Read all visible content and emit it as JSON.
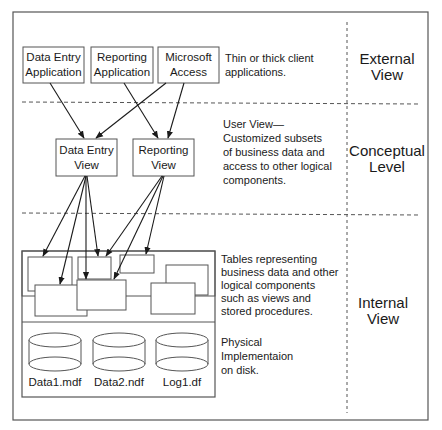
{
  "client_apps": [
    {
      "line1": "Data Entry",
      "line2": "Application"
    },
    {
      "line1": "Reporting",
      "line2": "Application"
    },
    {
      "line1": "Microsoft",
      "line2": "Access"
    }
  ],
  "client_desc": [
    "Thin or thick client",
    "applications."
  ],
  "views": [
    {
      "line1": "Data Entry",
      "line2": "View"
    },
    {
      "line1": "Reporting",
      "line2": "View"
    }
  ],
  "view_desc": [
    "User View—",
    "Customized subsets",
    "of business data and",
    "access to other logical",
    "components."
  ],
  "tables_desc": [
    "Tables representing",
    "business data and other",
    "logical components",
    "such as views and",
    "stored procedures."
  ],
  "files": [
    "Data1.mdf",
    "Data2.ndf",
    "Log1.df"
  ],
  "physical_desc": [
    "Physical",
    "Implementaion",
    "on disk."
  ],
  "levels": [
    {
      "line1": "External",
      "line2": "View"
    },
    {
      "line1": "Conceptual",
      "line2": "Level"
    },
    {
      "line1": "Internal",
      "line2": "View"
    }
  ],
  "colors": {
    "line": "#555555",
    "text": "#1a1a1a",
    "background": "#ffffff"
  }
}
